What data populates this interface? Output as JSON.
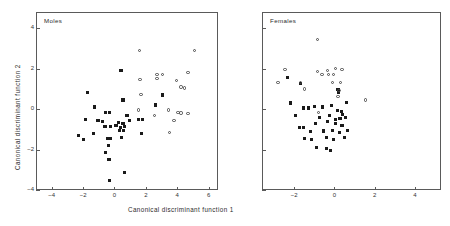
{
  "figure": {
    "xlabel": "Canonical discriminant function 1",
    "ylabel": "Canonical discriminant function 2",
    "marker_colors": {
      "filled_square": "#1a1a1a",
      "open_circle": "#4a4a4a",
      "axis": "#5a5a5a"
    }
  },
  "chart_data": [
    {
      "type": "scatter",
      "title": "Moles",
      "xlabel": "Canonical discriminant function 1",
      "ylabel": "Canonical discriminant function 2",
      "xlim": [
        -5.0,
        6.6
      ],
      "ylim": [
        -4.0,
        4.8
      ],
      "xticks": [
        -4,
        -2,
        0,
        2,
        4,
        6
      ],
      "xticklabels": [
        "-4",
        "-2",
        "0",
        "2",
        "4",
        "6"
      ],
      "yticks": [
        -4,
        -2,
        0,
        2,
        4
      ],
      "yticklabels": [
        "-4",
        "-2",
        "0",
        "2",
        "4"
      ],
      "grid": false,
      "legend": "none",
      "series": [
        {
          "name": "filled-square-group",
          "marker": "filled_square",
          "points": [
            [
              0.42,
              1.9
            ],
            [
              -1.7,
              0.8
            ],
            [
              -1.25,
              0.1
            ],
            [
              -0.55,
              -0.15
            ],
            [
              -0.3,
              -0.15
            ],
            [
              0.55,
              0.45
            ],
            [
              2.6,
              0.2
            ],
            [
              3.05,
              0.7
            ],
            [
              -1.85,
              -0.5
            ],
            [
              -1.05,
              -0.55
            ],
            [
              -0.75,
              -0.6
            ],
            [
              0.8,
              -0.3
            ],
            [
              0.25,
              -0.65
            ],
            [
              0.55,
              -0.72
            ],
            [
              0.95,
              -0.55
            ],
            [
              1.55,
              -0.5
            ],
            [
              1.8,
              -0.5
            ],
            [
              -1.35,
              -1.2
            ],
            [
              -2.3,
              -1.3
            ],
            [
              -1.95,
              -1.5
            ],
            [
              -0.6,
              -0.85
            ],
            [
              -0.25,
              -0.85
            ],
            [
              0.1,
              -0.8
            ],
            [
              0.4,
              -0.9
            ],
            [
              0.65,
              -0.85
            ],
            [
              0.3,
              -1.05
            ],
            [
              0.6,
              -1.05
            ],
            [
              -0.45,
              -1.45
            ],
            [
              -0.25,
              -1.45
            ],
            [
              0.45,
              -1.4
            ],
            [
              1.7,
              -1.2
            ],
            [
              -0.4,
              -1.8
            ],
            [
              -0.55,
              -2.15
            ],
            [
              -0.35,
              -2.5
            ],
            [
              -0.3,
              -3.55
            ],
            [
              0.62,
              -3.15
            ]
          ]
        },
        {
          "name": "open-circle-group",
          "marker": "open_circle",
          "points": [
            [
              1.6,
              2.9
            ],
            [
              5.1,
              2.9
            ],
            [
              1.62,
              1.45
            ],
            [
              2.7,
              1.7
            ],
            [
              3.05,
              1.7
            ],
            [
              2.72,
              1.5
            ],
            [
              4.7,
              1.8
            ],
            [
              3.95,
              1.4
            ],
            [
              4.25,
              1.1
            ],
            [
              4.45,
              1.05
            ],
            [
              1.7,
              0.72
            ],
            [
              1.55,
              -0.05
            ],
            [
              2.55,
              -0.32
            ],
            [
              3.45,
              -0.05
            ],
            [
              4.05,
              -0.18
            ],
            [
              4.25,
              -0.2
            ],
            [
              4.7,
              -0.22
            ],
            [
              3.8,
              -0.55
            ],
            [
              3.5,
              -1.15
            ]
          ]
        }
      ]
    },
    {
      "type": "scatter",
      "title": "Females",
      "xlabel": "Canonical discriminant function 1",
      "ylabel": "Canonical discriminant function 2",
      "xlim": [
        -3.6,
        5.3
      ],
      "ylim": [
        -4.0,
        4.8
      ],
      "xticks": [
        -2,
        0,
        2,
        4
      ],
      "xticklabels": [
        "-2",
        "0",
        "2",
        "4"
      ],
      "yticks": [
        -4,
        -2,
        0,
        2,
        4
      ],
      "yticklabels": [
        "",
        "",
        "",
        "",
        ""
      ],
      "grid": false,
      "legend": "none",
      "series": [
        {
          "name": "filled-square-group",
          "marker": "filled_square",
          "points": [
            [
              -2.35,
              1.55
            ],
            [
              -1.7,
              1.25
            ],
            [
              0.18,
              0.95
            ],
            [
              0.22,
              0.8
            ],
            [
              -2.2,
              0.3
            ],
            [
              0.6,
              0.32
            ],
            [
              -1.55,
              0.05
            ],
            [
              -1.3,
              0.05
            ],
            [
              -1.0,
              0.12
            ],
            [
              -0.6,
              0.1
            ],
            [
              -0.15,
              0.18
            ],
            [
              0.15,
              -0.05
            ],
            [
              0.35,
              -0.1
            ],
            [
              0.4,
              -0.28
            ],
            [
              -1.95,
              -0.3
            ],
            [
              -0.75,
              -0.4
            ],
            [
              -0.25,
              -0.32
            ],
            [
              0.05,
              -0.5
            ],
            [
              0.28,
              -0.45
            ],
            [
              0.55,
              -0.42
            ],
            [
              -1.75,
              -0.9
            ],
            [
              -1.55,
              -0.9
            ],
            [
              -0.95,
              -0.7
            ],
            [
              -0.35,
              -0.62
            ],
            [
              0.05,
              -0.72
            ],
            [
              0.38,
              -0.8
            ],
            [
              -1.2,
              -1.1
            ],
            [
              -0.55,
              -1.08
            ],
            [
              -0.1,
              -1.05
            ],
            [
              0.25,
              -1.15
            ],
            [
              0.65,
              -1.05
            ],
            [
              -1.5,
              -1.45
            ],
            [
              -1.15,
              -1.5
            ],
            [
              -0.4,
              -1.4
            ],
            [
              -0.05,
              -1.5
            ],
            [
              0.5,
              -1.4
            ],
            [
              -0.9,
              -1.9
            ],
            [
              -0.4,
              -1.95
            ],
            [
              -0.2,
              -2.05
            ]
          ]
        },
        {
          "name": "open-circle-group",
          "marker": "open_circle",
          "points": [
            [
              -0.85,
              3.45
            ],
            [
              -2.45,
              1.95
            ],
            [
              -0.85,
              1.85
            ],
            [
              -0.35,
              1.9
            ],
            [
              0.05,
              2.0
            ],
            [
              0.38,
              1.95
            ],
            [
              -0.62,
              1.72
            ],
            [
              -0.3,
              1.72
            ],
            [
              -0.05,
              1.72
            ],
            [
              -2.8,
              1.3
            ],
            [
              -1.7,
              1.32
            ],
            [
              -0.1,
              1.3
            ],
            [
              0.3,
              1.3
            ],
            [
              -1.5,
              1.0
            ],
            [
              0.22,
              0.92
            ],
            [
              0.18,
              0.62
            ],
            [
              1.55,
              0.45
            ],
            [
              -0.8,
              -0.18
            ]
          ]
        }
      ]
    }
  ]
}
